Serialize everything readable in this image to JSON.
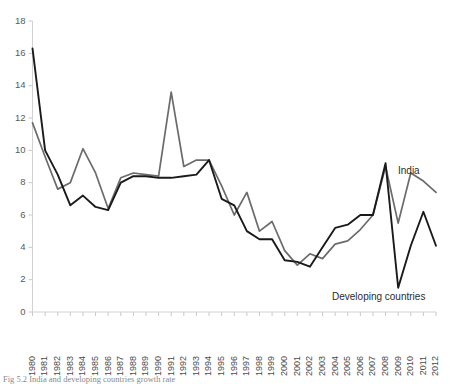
{
  "chart_data": {
    "type": "line",
    "title": "",
    "xlabel": "",
    "ylabel": "",
    "ylim": [
      0,
      18
    ],
    "ytick_step": 2,
    "yticks": [
      0,
      2,
      4,
      6,
      8,
      10,
      12,
      14,
      16,
      18
    ],
    "grid": false,
    "legend_position": "inline-annotation",
    "categories": [
      "1980",
      "1981",
      "1982",
      "1983",
      "1984",
      "1985",
      "1986",
      "1987",
      "1988",
      "1989",
      "1990",
      "1991",
      "1992",
      "1993",
      "1994",
      "1995",
      "1996",
      "1997",
      "1998",
      "1999",
      "2000",
      "2001",
      "2002",
      "2003",
      "2004",
      "2005",
      "2006",
      "2007",
      "2008",
      "2009",
      "2010",
      "2011",
      "2012"
    ],
    "series": [
      {
        "name": "India",
        "color": "#6b6b6b",
        "width": 1.7,
        "values": [
          11.7,
          9.6,
          7.6,
          8.0,
          10.1,
          8.6,
          6.4,
          8.3,
          8.6,
          8.5,
          8.4,
          13.6,
          9.0,
          9.4,
          9.4,
          7.8,
          6.0,
          7.4,
          5.0,
          5.6,
          3.8,
          2.9,
          3.6,
          3.3,
          4.2,
          4.4,
          5.1,
          6.0,
          9.0,
          5.5,
          8.6,
          8.1,
          7.4
        ]
      },
      {
        "name": "Developing countries",
        "color": "#1a1a1a",
        "width": 1.9,
        "values": [
          16.3,
          10.0,
          8.5,
          6.6,
          7.2,
          6.5,
          6.3,
          8.0,
          8.4,
          8.4,
          8.3,
          8.3,
          8.4,
          8.5,
          9.4,
          7.0,
          6.6,
          5.0,
          4.5,
          4.5,
          3.2,
          3.1,
          2.8,
          4.0,
          5.2,
          5.4,
          6.0,
          6.0,
          9.2,
          1.5,
          4.1,
          6.2,
          4.1
        ]
      }
    ],
    "annotations": [
      {
        "text": "India",
        "series": "India",
        "x": 398,
        "y": 171
      },
      {
        "text": "Developing countries",
        "series": "Developing countries",
        "x": 332,
        "y": 297
      }
    ]
  },
  "caption": {
    "text": "Fig 5.2 India and developing countries growth rate"
  }
}
